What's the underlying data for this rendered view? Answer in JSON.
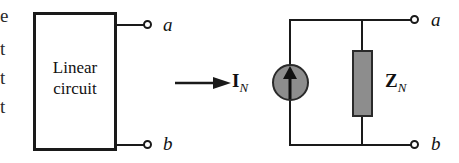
{
  "figure": {
    "background_color": "#ffffff",
    "line_color": "#1a1a1a",
    "fill_gray": "#8d8d8d"
  },
  "margin_text_fragments": [
    {
      "text": "e",
      "top": 6
    },
    {
      "text": "t",
      "top": 39
    },
    {
      "text": "t",
      "top": 68
    },
    {
      "text": "t",
      "top": 97
    }
  ],
  "left_circuit": {
    "box_label_line1": "Linear",
    "box_label_line2": "circuit",
    "terminal_a": "a",
    "terminal_b": "b"
  },
  "transform": {
    "arrow_direction": "right"
  },
  "right_circuit": {
    "source_symbol": "I",
    "source_subscript": "N",
    "source_type": "current-source",
    "source_arrow_direction": "up",
    "impedance_symbol": "Z",
    "impedance_subscript": "N",
    "terminal_a": "a",
    "terminal_b": "b"
  }
}
